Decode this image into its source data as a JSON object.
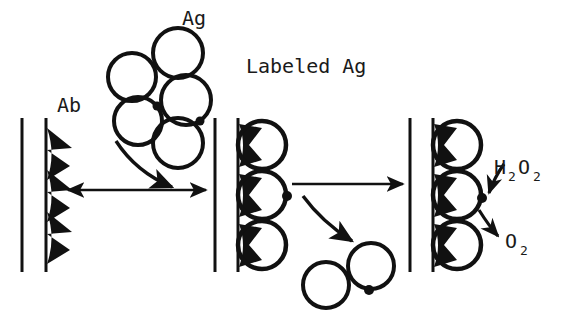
{
  "figure": {
    "title_text_present": false,
    "background_color": "#ffffff",
    "ink_color": "#111111",
    "width": 564,
    "height": 319
  },
  "labels": {
    "antibody": "Ab",
    "antigen": "Ag",
    "labeled_antigen": "Labeled Ag",
    "substrate": {
      "base1": "H",
      "sub1": "2",
      "base2": "O",
      "sub2": "2"
    },
    "product": {
      "base": "O",
      "sub": "2"
    }
  },
  "stages": [
    {
      "name": "stage-1-antibody-surface",
      "description": "Solid support with three immobilized antibodies",
      "surface_lines_x": [
        22,
        46
      ],
      "surface_y_top": 118,
      "surface_y_bottom": 272,
      "antibody_count": 3,
      "antigen_bound": false,
      "label": "Ab"
    },
    {
      "name": "stage-2-antigen-bound",
      "description": "Antigens bound to immobilized antibodies, one carries a label",
      "surface_lines_x": [
        215,
        238
      ],
      "surface_y_top": 118,
      "surface_y_bottom": 272,
      "antibody_count": 3,
      "antigen_bound": true,
      "labeled_antigen_index": 1
    },
    {
      "name": "stage-3-enzymatic-reaction",
      "description": "Labeled antigen converts substrate to product",
      "surface_lines_x": [
        410,
        433
      ],
      "surface_y_top": 118,
      "surface_y_bottom": 272,
      "antibody_count": 3,
      "antigen_bound": true,
      "labeled_antigen_index": 1
    }
  ],
  "antigen_cluster": {
    "name": "free-antigen-cluster",
    "count": 5,
    "labeled_count": 2,
    "circles": [
      {
        "cx": 132,
        "cy": 77,
        "r": 24,
        "labeled": false
      },
      {
        "cx": 178,
        "cy": 53,
        "r": 25,
        "labeled": false
      },
      {
        "cx": 186,
        "cy": 100,
        "r": 25,
        "labeled": true,
        "dot_angle_deg": 60
      },
      {
        "cx": 138,
        "cy": 121,
        "r": 24,
        "labeled": true,
        "dot_angle_deg": -40
      },
      {
        "cx": 178,
        "cy": 143,
        "r": 25,
        "labeled": false
      }
    ]
  },
  "released_antigens": {
    "name": "released-antigen-pair",
    "count": 2,
    "circles": [
      {
        "cx": 326,
        "cy": 285,
        "r": 23,
        "labeled": false
      },
      {
        "cx": 371,
        "cy": 266,
        "r": 23,
        "labeled": true,
        "dot_angle_deg": 95
      }
    ]
  },
  "arrows": [
    {
      "name": "arrow-stage1-to-stage2",
      "type": "straight",
      "double_headed": true,
      "from": [
        68,
        190
      ],
      "to": [
        206,
        190
      ]
    },
    {
      "name": "arrow-antigen-binding",
      "type": "curved",
      "double_headed": false,
      "from": [
        118,
        142
      ],
      "to": [
        178,
        190
      ]
    },
    {
      "name": "arrow-stage2-to-stage3",
      "type": "straight",
      "double_headed": false,
      "from": [
        290,
        184
      ],
      "to": [
        403,
        184
      ]
    },
    {
      "name": "arrow-antigen-release",
      "type": "curved",
      "double_headed": false,
      "from": [
        305,
        196
      ],
      "to": [
        360,
        243
      ]
    },
    {
      "name": "arrow-substrate-in",
      "type": "curved",
      "double_headed": false,
      "from": [
        492,
        168
      ],
      "to": [
        468,
        196
      ]
    },
    {
      "name": "arrow-product-out",
      "type": "curved",
      "double_headed": false,
      "from": [
        462,
        208
      ],
      "to": [
        492,
        238
      ]
    }
  ],
  "text_positions": {
    "ag": {
      "x": 182,
      "y": 25
    },
    "ab": {
      "x": 57,
      "y": 112
    },
    "labeled_ag": {
      "x": 246,
      "y": 73
    },
    "h2o2": {
      "x": 496,
      "y": 174
    },
    "o2": {
      "x": 505,
      "y": 248
    }
  }
}
